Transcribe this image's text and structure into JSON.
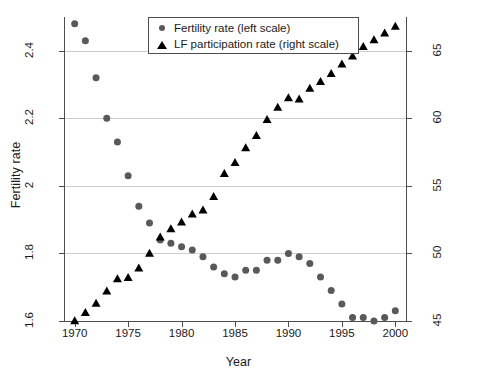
{
  "chart_data": {
    "type": "scatter",
    "title": "",
    "xlabel": "Year",
    "ylabel": "Fertility rate",
    "ylabel_right": "Female LF participation rate",
    "xlim": [
      1969,
      2001
    ],
    "ylim": [
      1.6,
      2.5
    ],
    "ylim_right": [
      45,
      67.5
    ],
    "xticks": [
      1970,
      1975,
      1980,
      1985,
      1990,
      1995,
      2000
    ],
    "xtick_labels": [
      "1970",
      "1975",
      "1980",
      "1985",
      "1990",
      "1995",
      "2000"
    ],
    "yticks_left": [
      1.6,
      1.8,
      2,
      2.2,
      2.4
    ],
    "ytick_labels_left": [
      "1.6",
      "1.8",
      "2",
      "2.2",
      "2.4"
    ],
    "yticks_right": [
      45,
      50,
      55,
      60,
      65
    ],
    "ytick_labels_right": [
      "45",
      "50",
      "55",
      "60",
      "65"
    ],
    "grid": true,
    "grid_axis": "y",
    "legend_position": "top-center",
    "x": [
      1970,
      1971,
      1972,
      1973,
      1974,
      1975,
      1976,
      1977,
      1978,
      1979,
      1980,
      1981,
      1982,
      1983,
      1984,
      1985,
      1986,
      1987,
      1988,
      1989,
      1990,
      1991,
      1992,
      1993,
      1994,
      1995,
      1996,
      1997,
      1998,
      1999,
      2000
    ],
    "series": [
      {
        "name": "Fertility rate",
        "legend_label": "Fertility rate (left scale)",
        "scale": "left",
        "marker": "circle",
        "color": "#595959",
        "values": [
          2.48,
          2.43,
          2.32,
          2.2,
          2.13,
          2.03,
          1.94,
          1.89,
          1.84,
          1.83,
          1.82,
          1.81,
          1.79,
          1.76,
          1.74,
          1.73,
          1.75,
          1.75,
          1.78,
          1.78,
          1.8,
          1.79,
          1.77,
          1.73,
          1.69,
          1.65,
          1.61,
          1.61,
          1.6,
          1.61,
          1.63
        ]
      },
      {
        "name": "LF participation rate",
        "legend_label": "LF participation rate (right scale)",
        "scale": "right",
        "marker": "triangle",
        "color": "#000000",
        "values": [
          45.0,
          45.6,
          46.3,
          47.2,
          48.1,
          48.2,
          48.9,
          50.0,
          51.2,
          51.8,
          52.3,
          52.9,
          53.2,
          54.2,
          55.9,
          56.7,
          57.8,
          58.7,
          59.9,
          60.8,
          61.5,
          61.4,
          62.2,
          62.7,
          63.3,
          64.0,
          64.6,
          65.3,
          65.8,
          66.3,
          66.8
        ]
      }
    ]
  },
  "legend": {
    "items": [
      {
        "marker": "circle",
        "label": "Fertility rate (left scale)"
      },
      {
        "marker": "triangle",
        "label": "LF participation rate (right scale)"
      }
    ]
  },
  "colors": {
    "fertility_marker": "#595959",
    "lf_marker": "#000000",
    "grid": "#cccccc",
    "axis": "#4d4d4d",
    "background": "#ffffff"
  }
}
